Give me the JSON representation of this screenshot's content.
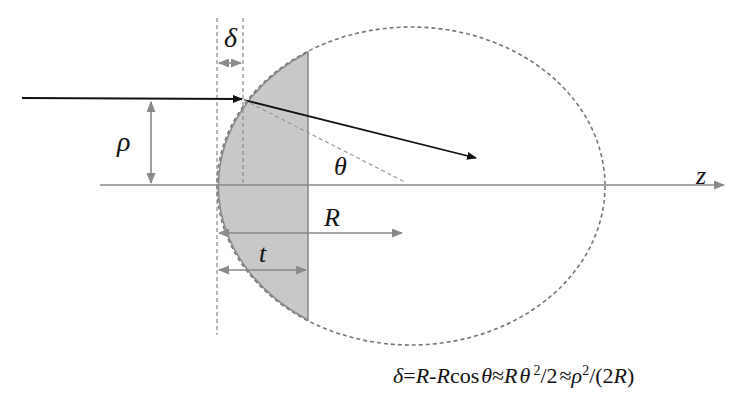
{
  "diagram": {
    "labels": {
      "delta": "δ",
      "rho": "ρ",
      "theta": "θ",
      "z": "z",
      "R": "R",
      "t": "t"
    },
    "equation": {
      "delta": "δ",
      "p1": "=",
      "R1": "R",
      "p2": "-",
      "R2": "R",
      "cos": "cos",
      "theta1": "θ",
      "approx1": "≈",
      "R3": "R",
      "theta2": "θ",
      "sup1": "2",
      "p3": "/2",
      "approx2": "≈",
      "rho": "ρ",
      "sup2": "2",
      "p4": "/(2",
      "R4": "R",
      "p5": ")"
    },
    "colors": {
      "lens_fill": "#c8c8c8",
      "line_gray": "#8a8a8a",
      "ray": "#111111",
      "dashed": "#777777"
    }
  }
}
